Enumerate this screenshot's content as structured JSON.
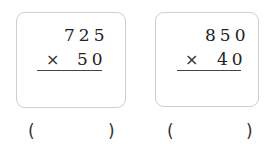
{
  "problems": [
    {
      "multiplicand": "725",
      "operator": "×",
      "multiplier": "50",
      "answer": "",
      "open_paren": "(",
      "close_paren": ")"
    },
    {
      "multiplicand": "850",
      "operator": "×",
      "multiplier": "40",
      "answer": "",
      "open_paren": "(",
      "close_paren": ")"
    }
  ]
}
